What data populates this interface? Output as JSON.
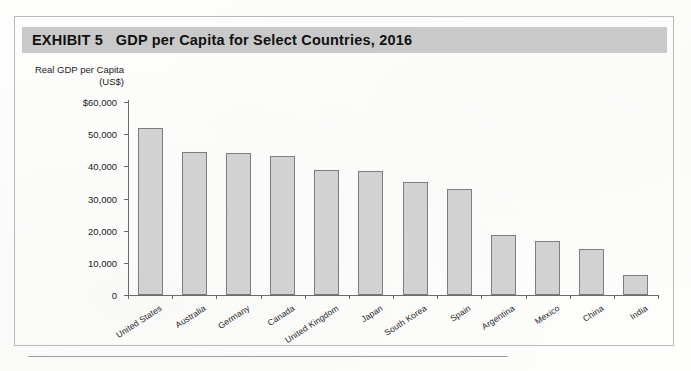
{
  "exhibit": {
    "title": "EXHIBIT 5   GDP per Capita for Select Countries, 2016",
    "label": "EXHIBIT 5",
    "number": "5"
  },
  "axis": {
    "y_caption_line1": "Real GDP per Capita",
    "y_caption_line2": "(US$)",
    "y_ticks": [
      "$60,000",
      "50,000",
      "40,000",
      "30,000",
      "20,000",
      "10,000",
      "0"
    ],
    "y_tick_values": [
      60000,
      50000,
      40000,
      30000,
      20000,
      10000,
      0
    ]
  },
  "colors": {
    "banner": "#c9c9c9",
    "bar_fill": "#d2d2d2",
    "bar_stroke": "#7d7d7d",
    "axis": "#6b6b6b",
    "frame": "#b9b9b9",
    "text": "#1a1a1a"
  },
  "chart_data": {
    "type": "bar",
    "title": "GDP per Capita for Select Countries, 2016",
    "xlabel": "",
    "ylabel": "Real GDP per Capita (US$)",
    "ylim": [
      0,
      60000
    ],
    "ytick_interval": 10000,
    "grid": false,
    "legend": "none",
    "categories": [
      "United States",
      "Australia",
      "Germany",
      "Canada",
      "United Kingdom",
      "Japan",
      "South Korea",
      "Spain",
      "Argentina",
      "Mexico",
      "China",
      "India"
    ],
    "values": [
      51800,
      44600,
      44200,
      43200,
      38900,
      38500,
      35100,
      33100,
      18600,
      16800,
      14400,
      6200
    ],
    "units": "US$"
  }
}
